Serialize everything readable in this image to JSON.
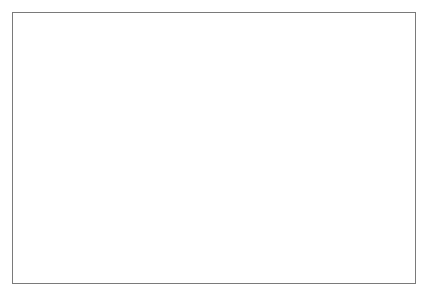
{
  "chart_data": {
    "type": "line",
    "title": "",
    "xlabel": "",
    "ylabel": "Profits, before depreciation, interest & tax, as % of output.",
    "ylabel_right": "Difference between actual GDP & potential GDP as % of potential.",
    "x": [
      1987,
      1988,
      1989,
      1990,
      1991,
      1992,
      1993,
      1994,
      1995,
      1996,
      1997,
      1998,
      1999,
      2000,
      2001,
      2002,
      2003,
      2004,
      2005,
      2006,
      2007,
      2008,
      2009,
      2010
    ],
    "xlim": [
      1986.5,
      2010.5
    ],
    "xticks": [
      1987,
      1989,
      1991,
      1993,
      1995,
      1997,
      1999,
      2001,
      2003,
      2005,
      2007,
      2009
    ],
    "xtick_labels": [
      "1987",
      "1989",
      "1991",
      "1993",
      "1995",
      "1997",
      "1999",
      "2001",
      "2003",
      "2005",
      "2007",
      "2009"
    ],
    "ylim": [
      27,
      40
    ],
    "yticks": [
      27,
      28,
      29,
      30,
      31,
      32,
      33,
      34,
      35,
      36,
      37,
      38,
      39,
      40
    ],
    "ytick_labels": [
      "27",
      "28",
      "29",
      "30",
      "31",
      "32",
      "33",
      "34",
      "35",
      "36",
      "37",
      "38",
      "39",
      "40"
    ],
    "ylim_right": [
      -5,
      7
    ],
    "yticks_right": [
      -5,
      -3,
      -1,
      1,
      3,
      5,
      7
    ],
    "ytick_labels_right": [
      "-5",
      "-3",
      "-1",
      "1",
      "3",
      "5",
      "7"
    ],
    "grid": true,
    "legend_position": "center-right-inside",
    "series": [
      {
        "name": "UK profit margins",
        "axis": "left",
        "marker": "square-gray",
        "x": [
          1987,
          1988,
          1989,
          1990,
          1991,
          1992,
          1993,
          1994,
          1995,
          1996,
          1997,
          1998,
          1999,
          2000,
          2001,
          2002,
          2003,
          2004,
          2005,
          2006,
          2007,
          2008,
          2009,
          2010
        ],
        "values": [
          37.4,
          37.45,
          37.15,
          34.95,
          33.75,
          34.8,
          35.8,
          37.0,
          38.3,
          39.6,
          38.9,
          37.0,
          35.0,
          34.1,
          34.6,
          35.05,
          35.4,
          36.25,
          36.5,
          37.3,
          38.0,
          37.8,
          35.25,
          35.9
        ]
      },
      {
        "name": "Output gap Vol 64",
        "axis": "right",
        "marker": "square-dark",
        "x": [
          1987,
          1988,
          1989,
          1990,
          1991,
          1992,
          1993
        ],
        "values": [
          3.1,
          6.05,
          5.3,
          3.15,
          -1.35,
          -3.4,
          -3.65
        ]
      },
      {
        "name": "Output gap Vol 90",
        "axis": "right",
        "marker": "none",
        "x": [
          1992,
          1993,
          1994,
          1995,
          1996,
          1997,
          1998,
          1999,
          2000,
          2001,
          2002,
          2003,
          2004,
          2005,
          2006,
          2007,
          2008,
          2009,
          2010
        ],
        "values": [
          -3.4,
          -3.65,
          -1.5,
          -1.35,
          -1.25,
          -0.95,
          -0.7,
          -0.75,
          -0.15,
          -0.35,
          -0.6,
          0.05,
          0.45,
          0.25,
          0.65,
          3.1,
          0.6,
          -4.35,
          -2.6
        ]
      }
    ]
  },
  "legend": {
    "items": [
      {
        "label": "UK profit margins"
      },
      {
        "label": "Output gap Vol 64"
      },
      {
        "label": "Output gap Vol 90"
      }
    ]
  }
}
